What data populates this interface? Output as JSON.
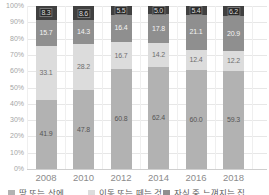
{
  "chart_data": {
    "type": "bar",
    "variant": "stacked-100-percent",
    "categories": [
      "2008",
      "2010",
      "2012",
      "2014",
      "2016",
      "2018"
    ],
    "series": [
      {
        "name": "땅 또는 산에",
        "color": "#b2b2b2",
        "label_color": "#555555",
        "values": [
          41.9,
          47.8,
          60.8,
          62.4,
          60.0,
          59.3
        ]
      },
      {
        "name": "이동 또는 떼는 것",
        "color": "#dcdcdc",
        "label_color": "#6e6e6e",
        "values": [
          33.1,
          28.2,
          16.7,
          14.2,
          12.4,
          12.2
        ]
      },
      {
        "name": "자식 중 느껴지는 집",
        "color": "#8f8f8f",
        "label_color": "#f4f4f4",
        "values": [
          15.7,
          14.3,
          16.4,
          17.8,
          21.1,
          20.9
        ]
      },
      {
        "name": "",
        "color": "#404040",
        "label_color": "#d9d9d9",
        "values": [
          8.3,
          8.6,
          5.5,
          5.0,
          5.4,
          6.2
        ]
      }
    ],
    "y_ticks": [
      "100%",
      "90%",
      "80%",
      "70%",
      "60%",
      "50%",
      "40%",
      "30%",
      "20%",
      "10%",
      "0%"
    ],
    "ylim": [
      0,
      100
    ],
    "grid": true,
    "legend_position": "bottom",
    "legend_clipped": true
  },
  "legend": {
    "items": [
      {
        "label": "땅 또는 산에",
        "color": "#b2b2b2"
      },
      {
        "label": "이동 또는 떼는 것",
        "color": "#dcdcdc"
      },
      {
        "label": "자식 중 느껴지는 집",
        "color": "#8f8f8f"
      }
    ]
  },
  "colors": {
    "background": "#ffffff",
    "gridline": "#e7e7e7",
    "axis_line": "#cfcfcf",
    "tick_text": "#a5a5a5",
    "category_text": "#8c8c8c"
  }
}
